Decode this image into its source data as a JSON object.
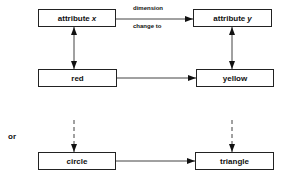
{
  "diagram": {
    "nodes": {
      "attr_x": {
        "label": "attribute",
        "var": "x"
      },
      "attr_y": {
        "label": "attribute",
        "var": "y"
      },
      "red": {
        "label": "red"
      },
      "yellow": {
        "label": "yellow"
      },
      "circle": {
        "label": "circle"
      },
      "triangle": {
        "label": "triangle"
      }
    },
    "edge_labels": {
      "top": "dimension",
      "bottom": "change to"
    },
    "separator_label": "or",
    "edges": [
      {
        "from": "attr_x",
        "to": "attr_y",
        "style": "solid",
        "arrow": "end"
      },
      {
        "from": "attr_x",
        "to": "red",
        "style": "solid",
        "arrow": "both"
      },
      {
        "from": "attr_y",
        "to": "yellow",
        "style": "solid",
        "arrow": "both"
      },
      {
        "from": "red",
        "to": "yellow",
        "style": "solid",
        "arrow": "end"
      },
      {
        "from": "above",
        "to": "circle",
        "style": "dashed",
        "arrow": "end"
      },
      {
        "from": "above",
        "to": "triangle",
        "style": "dashed",
        "arrow": "end"
      },
      {
        "from": "circle",
        "to": "triangle",
        "style": "solid",
        "arrow": "end"
      }
    ]
  }
}
